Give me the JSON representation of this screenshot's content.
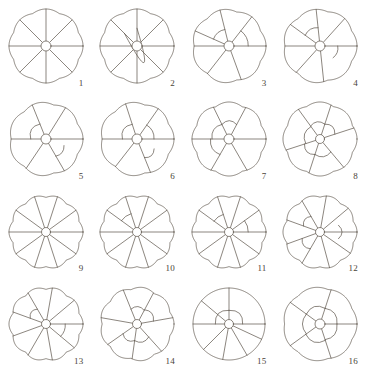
{
  "plate": {
    "kind": "botanical-radial-cross-section-plate",
    "title": "",
    "background_color": "#ffffff",
    "line_color": "#5a5248",
    "label_color": "#4a4338",
    "stroke_width": 0.7,
    "grid": {
      "columns": 4,
      "rows": 4,
      "count": 16
    }
  },
  "figures": [
    {
      "label": "1",
      "radius": 37,
      "center_radius": 5,
      "lobes": 8,
      "lobe_depth": 2.0,
      "spokes": [
        0,
        45,
        90,
        135,
        180,
        225,
        270,
        315
      ],
      "arcs": [],
      "description": "Eight equal radial segments, undivided; small circular center."
    },
    {
      "label": "2",
      "radius": 37,
      "center_radius": 5,
      "lobes": 8,
      "lobe_depth": 2.0,
      "spokes": [
        0,
        45,
        90,
        135,
        180,
        225,
        270,
        315
      ],
      "arcs": [
        {
          "from": 135,
          "to": 90,
          "bulge": 0.52,
          "inner": 0.48
        }
      ],
      "description": "Eight radial segments; upper-left segment subdivided by a curved partition."
    },
    {
      "label": "3",
      "radius": 37,
      "center_radius": 5,
      "lobes": 7,
      "lobe_depth": 2.2,
      "spokes": [
        0,
        52,
        104,
        156,
        180,
        232,
        290
      ],
      "arcs": [
        {
          "from": 104,
          "to": 156,
          "bulge": 0.5,
          "inner": 0.46
        },
        {
          "from": 0,
          "to": 52,
          "bulge": 0.56,
          "inner": 0.52
        }
      ],
      "description": "Six to seven segments; two outer cells cut off by curved partitions."
    },
    {
      "label": "4",
      "radius": 37,
      "center_radius": 5,
      "lobes": 7,
      "lobe_depth": 2.0,
      "spokes": [
        0,
        48,
        96,
        144,
        180,
        228,
        276
      ],
      "arcs": [
        {
          "from": 96,
          "to": 144,
          "bulge": 0.54,
          "inner": 0.5
        },
        {
          "from": 318,
          "to": 0,
          "bulge": 0.52,
          "inner": 0.48
        }
      ],
      "description": "Seven segments; upper-left and lower-right outer cells partitioned."
    },
    {
      "label": "5",
      "radius": 37,
      "center_radius": 5,
      "lobes": 7,
      "lobe_depth": 2.2,
      "spokes": [
        0,
        58,
        112,
        180,
        236,
        300
      ],
      "arcs": [
        {
          "from": 112,
          "to": 180,
          "bulge": 0.48,
          "inner": 0.44
        },
        {
          "from": 300,
          "to": 340,
          "bulge": 0.58,
          "inner": 0.54
        }
      ],
      "description": "Six broad segments; upper-left large cell and lower-right small cell cut off."
    },
    {
      "label": "6",
      "radius": 37,
      "center_radius": 5,
      "lobes": 7,
      "lobe_depth": 2.2,
      "spokes": [
        0,
        55,
        108,
        180,
        232,
        292
      ],
      "arcs": [
        {
          "from": 108,
          "to": 180,
          "bulge": 0.46,
          "inner": 0.42
        },
        {
          "from": 0,
          "to": 55,
          "bulge": 0.5,
          "inner": 0.46
        },
        {
          "from": 292,
          "to": 330,
          "bulge": 0.6,
          "inner": 0.56
        }
      ],
      "description": "Six segments with three peripheral cells separated by curved walls."
    },
    {
      "label": "7",
      "radius": 37,
      "center_radius": 5,
      "lobes": 8,
      "lobe_depth": 2.2,
      "spokes": [
        0,
        62,
        116,
        180,
        240,
        300
      ],
      "arcs": [
        {
          "from": 62,
          "to": 116,
          "bulge": 0.5,
          "inner": 0.46
        },
        {
          "from": 116,
          "to": 180,
          "bulge": 0.5,
          "inner": 0.46
        },
        {
          "from": 180,
          "to": 240,
          "bulge": 0.54,
          "inner": 0.5
        }
      ],
      "description": "Five to six segments; three adjacent outer cells partitioned off."
    },
    {
      "label": "8",
      "radius": 37,
      "center_radius": 4.5,
      "lobes": 8,
      "lobe_depth": 2.0,
      "spokes": [
        18,
        72,
        126,
        198,
        252,
        310
      ],
      "arcs": [
        {
          "from": 18,
          "to": 72,
          "bulge": 0.48,
          "inner": 0.44
        },
        {
          "from": 72,
          "to": 126,
          "bulge": 0.48,
          "inner": 0.44
        },
        {
          "from": 126,
          "to": 198,
          "bulge": 0.46,
          "inner": 0.42
        },
        {
          "from": 198,
          "to": 252,
          "bulge": 0.5,
          "inner": 0.46
        },
        {
          "from": 252,
          "to": 310,
          "bulge": 0.5,
          "inner": 0.46
        }
      ],
      "description": "Radial spokes with a complete ring of five to six separated peripheral cells."
    },
    {
      "label": "9",
      "radius": 37,
      "center_radius": 4.5,
      "lobes": 10,
      "lobe_depth": 2.4,
      "spokes": [
        0,
        36,
        72,
        108,
        144,
        180,
        216,
        252,
        288,
        324
      ],
      "arcs": [],
      "description": "Ten narrow equal radial segments; undivided, scalloped margin."
    },
    {
      "label": "10",
      "radius": 37,
      "center_radius": 4.5,
      "lobes": 10,
      "lobe_depth": 2.4,
      "spokes": [
        0,
        36,
        72,
        108,
        144,
        180,
        216,
        252,
        288,
        324
      ],
      "arcs": [
        {
          "from": 108,
          "to": 144,
          "bulge": 0.56,
          "inner": 0.52
        }
      ],
      "description": "Ten radial segments; one upper-left segment cut by a curved partition."
    },
    {
      "label": "11",
      "radius": 37,
      "center_radius": 4.5,
      "lobes": 10,
      "lobe_depth": 2.4,
      "spokes": [
        0,
        36,
        72,
        108,
        144,
        180,
        216,
        252,
        288,
        324
      ],
      "arcs": [
        {
          "from": 108,
          "to": 144,
          "bulge": 0.54,
          "inner": 0.5
        },
        {
          "from": 0,
          "to": 36,
          "bulge": 0.56,
          "inner": 0.52
        }
      ],
      "description": "Ten radial segments; two outer cells partitioned at upper left and right."
    },
    {
      "label": "12",
      "radius": 37,
      "center_radius": 4.5,
      "lobes": 10,
      "lobe_depth": 2.2,
      "spokes": [
        0,
        40,
        80,
        120,
        160,
        200,
        240,
        285,
        325
      ],
      "arcs": [
        {
          "from": 120,
          "to": 160,
          "bulge": 0.54,
          "inner": 0.5
        },
        {
          "from": 340,
          "to": 20,
          "bulge": 0.6,
          "inner": 0.56
        },
        {
          "from": 200,
          "to": 240,
          "bulge": 0.58,
          "inner": 0.54
        }
      ],
      "description": "Nine to ten segments; three peripheral cells separated by arcs."
    },
    {
      "label": "13",
      "radius": 37,
      "center_radius": 4.5,
      "lobes": 10,
      "lobe_depth": 2.4,
      "spokes": [
        0,
        40,
        80,
        120,
        160,
        200,
        240,
        280,
        320
      ],
      "arcs": [
        {
          "from": 120,
          "to": 160,
          "bulge": 0.52,
          "inner": 0.48
        },
        {
          "from": 320,
          "to": 0,
          "bulge": 0.56,
          "inner": 0.52
        }
      ],
      "description": "Nine to ten segments; upper-left and lower-right outer cells partitioned."
    },
    {
      "label": "14",
      "radius": 37,
      "center_radius": 4.5,
      "lobes": 9,
      "lobe_depth": 2.2,
      "spokes": [
        10,
        62,
        112,
        170,
        215,
        262,
        312
      ],
      "arcs": [
        {
          "from": 62,
          "to": 112,
          "bulge": 0.48,
          "inner": 0.44
        },
        {
          "from": 10,
          "to": 62,
          "bulge": 0.5,
          "inner": 0.46
        },
        {
          "from": 215,
          "to": 262,
          "bulge": 0.52,
          "inner": 0.48
        },
        {
          "from": 262,
          "to": 312,
          "bulge": 0.52,
          "inner": 0.48
        }
      ],
      "description": "Seven segments with four peripheral cells cut off around the margin."
    },
    {
      "label": "15",
      "radius": 36,
      "center_radius": 4.5,
      "lobes": 1,
      "lobe_depth": 0.4,
      "spokes": [
        0,
        90,
        140,
        180,
        225,
        260,
        300,
        335
      ],
      "arcs": [
        {
          "from": 90,
          "to": 180,
          "bulge": 0.42,
          "inner": 0.38
        },
        {
          "from": 0,
          "to": 90,
          "bulge": 0.42,
          "inner": 0.38
        }
      ],
      "description": "Nearly circular outline; lower fan of narrow segments, two large upper cells."
    },
    {
      "label": "16",
      "radius": 37,
      "center_radius": 5,
      "lobes": 7,
      "lobe_depth": 1.6,
      "spokes": [
        0,
        72,
        144,
        216,
        288
      ],
      "arcs": [
        {
          "from": 72,
          "to": 144,
          "bulge": 0.5,
          "inner": 0.46
        },
        {
          "from": 0,
          "to": 72,
          "bulge": 0.5,
          "inner": 0.46
        },
        {
          "from": 144,
          "to": 216,
          "bulge": 0.5,
          "inner": 0.46
        },
        {
          "from": 216,
          "to": 288,
          "bulge": 0.52,
          "inner": 0.48
        },
        {
          "from": 288,
          "to": 0,
          "bulge": 0.5,
          "inner": 0.46
        }
      ],
      "description": "Five radial spokes with a ring of five large peripheral cells."
    }
  ]
}
